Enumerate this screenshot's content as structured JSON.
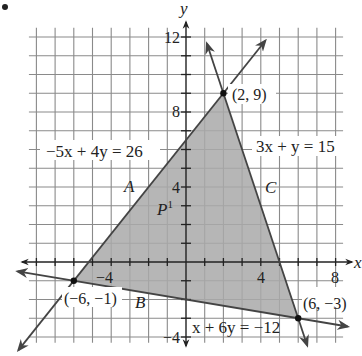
{
  "chart_data": {
    "type": "line",
    "title": "",
    "xlabel": "x",
    "ylabel": "y",
    "xlim": [
      -8,
      9
    ],
    "ylim": [
      -4.5,
      12.5
    ],
    "grid": true,
    "grid_step": 1,
    "x_ticks": [
      {
        "value": -4,
        "label": "−4"
      },
      {
        "value": 4,
        "label": "4"
      },
      {
        "value": 8,
        "label": "8"
      }
    ],
    "y_ticks": [
      {
        "value": 12,
        "label": "12"
      },
      {
        "value": 8,
        "label": "8"
      },
      {
        "value": 4,
        "label": "4"
      },
      {
        "value": -4,
        "label": "−4"
      }
    ],
    "lines": [
      {
        "name": "A",
        "equation": "−5x + 4y = 26",
        "through": [
          [
            -6,
            -1
          ],
          [
            2,
            9
          ]
        ]
      },
      {
        "name": "C",
        "equation": "3x + y = 15",
        "through": [
          [
            2,
            9
          ],
          [
            6,
            -3
          ]
        ]
      },
      {
        "name": "B",
        "equation": "x + 6y = −12",
        "through": [
          [
            -6,
            -1
          ],
          [
            6,
            -3
          ]
        ]
      }
    ],
    "vertices": [
      {
        "x": 2,
        "y": 9,
        "label": "(2, 9)"
      },
      {
        "x": -6,
        "y": -1,
        "label": "(−6, −1)"
      },
      {
        "x": 6,
        "y": -3,
        "label": "(6, −3)"
      }
    ],
    "shaded_region": {
      "vertices": [
        [
          -6,
          -1
        ],
        [
          2,
          9
        ],
        [
          6,
          -3
        ]
      ],
      "color": "#a9a9a9"
    },
    "annotations": [
      {
        "text": "A",
        "x": -4.4,
        "y": 5
      },
      {
        "text": "B",
        "x": -2.2,
        "y": -1.8
      },
      {
        "text": "C",
        "x": 4.5,
        "y": 4
      },
      {
        "text": "P¹",
        "x": -1.5,
        "y": 2
      }
    ]
  },
  "labels": {
    "axis_x": "x",
    "axis_y": "y",
    "eq_a": "−5x + 4y = 26",
    "eq_c": "3x + y = 15",
    "eq_b": "x + 6y = −12",
    "pt_top": "(2, 9)",
    "pt_left": "(−6, −1)",
    "pt_right": "(6, −3)",
    "line_a": "A",
    "line_b": "B",
    "line_c": "C",
    "region_p": "P",
    "region_p_sup": "1",
    "tick_x_neg4": "−4",
    "tick_x_4": "4",
    "tick_x_8": "8",
    "tick_y_12": "12",
    "tick_y_8": "8",
    "tick_y_4": "4",
    "tick_y_neg4": "−4"
  }
}
